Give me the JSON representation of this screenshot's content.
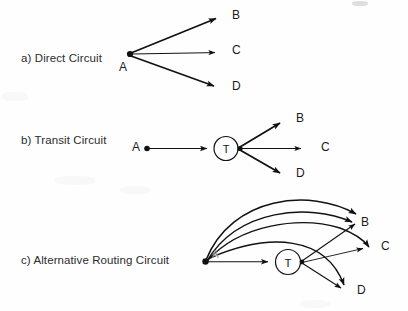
{
  "figure": {
    "background_color": "#fefefe",
    "stroke_color": "#111111",
    "width": 408,
    "height": 311
  },
  "rows": [
    {
      "id": "a",
      "caption": "a) Direct Circuit"
    },
    {
      "id": "b",
      "caption": "b) Transit Circuit"
    },
    {
      "id": "c",
      "caption": "c) Alternative Routing Circuit"
    }
  ],
  "nodes": {
    "a": [
      {
        "name": "A",
        "label": "A",
        "x": 130,
        "y": 54,
        "kind": "dot",
        "label_x": 119,
        "label_y": 60
      },
      {
        "name": "B",
        "label": "B",
        "x": 224,
        "y": 17,
        "kind": "terminal",
        "label_x": 232,
        "label_y": 8
      },
      {
        "name": "C",
        "label": "C",
        "x": 224,
        "y": 52,
        "kind": "terminal",
        "label_x": 232,
        "label_y": 43
      },
      {
        "name": "D",
        "label": "D",
        "x": 224,
        "y": 88,
        "kind": "terminal",
        "label_x": 232,
        "label_y": 79
      }
    ],
    "b": [
      {
        "name": "A",
        "label": "A",
        "x": 147,
        "y": 148,
        "kind": "dot",
        "label_x": 132,
        "label_y": 139
      },
      {
        "name": "T",
        "label": "T",
        "x": 226,
        "y": 148,
        "kind": "circle",
        "radius": 12
      },
      {
        "name": "B",
        "label": "B",
        "x": 288,
        "y": 120,
        "kind": "terminal",
        "label_x": 296,
        "label_y": 111
      },
      {
        "name": "C",
        "label": "C",
        "x": 312,
        "y": 148,
        "kind": "terminal",
        "label_x": 321,
        "label_y": 139
      },
      {
        "name": "D",
        "label": "D",
        "x": 288,
        "y": 175,
        "kind": "terminal",
        "label_x": 296,
        "label_y": 166
      }
    ],
    "c": [
      {
        "name": "A",
        "label": "A",
        "x": 205,
        "y": 262,
        "kind": "dot",
        "label_x": 212,
        "label_y": 250
      },
      {
        "name": "T",
        "label": "T",
        "x": 288,
        "y": 262,
        "kind": "circle",
        "radius": 13
      },
      {
        "name": "B",
        "label": "B",
        "x": 363,
        "y": 224,
        "kind": "terminal",
        "label_x": 362,
        "label_y": 216
      },
      {
        "name": "C",
        "label": "C",
        "x": 373,
        "y": 248,
        "kind": "terminal",
        "label_x": 381,
        "label_y": 239
      },
      {
        "name": "D",
        "label": "D",
        "x": 350,
        "y": 292,
        "kind": "terminal",
        "label_x": 357,
        "label_y": 283
      }
    ]
  },
  "edges": {
    "a": [
      {
        "from": "A",
        "to": "B",
        "style": "straight-thick"
      },
      {
        "from": "A",
        "to": "C",
        "style": "straight-thin"
      },
      {
        "from": "A",
        "to": "D",
        "style": "straight-thick"
      }
    ],
    "b": [
      {
        "from": "A",
        "to": "T",
        "style": "straight-thin"
      },
      {
        "from": "T",
        "to": "B",
        "style": "straight-thick"
      },
      {
        "from": "T",
        "to": "C",
        "style": "straight-thin"
      },
      {
        "from": "T",
        "to": "D",
        "style": "straight-thick"
      }
    ],
    "c": [
      {
        "from": "A",
        "to": "B",
        "style": "arc-outer"
      },
      {
        "from": "A",
        "to": "B",
        "style": "arc-middle"
      },
      {
        "from": "A",
        "to": "C",
        "style": "arc-inner-over-T"
      },
      {
        "from": "A",
        "to": "D",
        "style": "arc-low"
      },
      {
        "from": "A",
        "to": "T",
        "style": "straight-thin"
      },
      {
        "from": "T",
        "to": "B",
        "style": "straight-thin"
      },
      {
        "from": "T",
        "to": "C",
        "style": "straight-thin"
      },
      {
        "from": "T",
        "to": "D",
        "style": "straight-thin"
      }
    ]
  },
  "caption_text": {
    "a": "a) Direct Circuit",
    "b": "b) Transit Circuit",
    "c": "c) Alternative Routing Circuit"
  }
}
